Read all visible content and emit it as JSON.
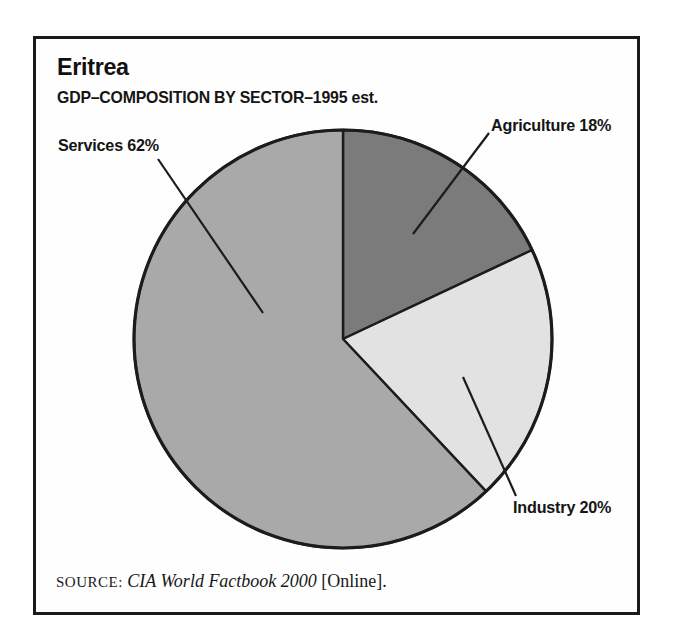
{
  "figure": {
    "country": "Eritrea",
    "subtitle": "GDP–COMPOSITION BY SECTOR–1995 est.",
    "source_prefix": "SOURCE:",
    "source_title": "CIA World Factbook 2000",
    "source_suffix": "[Online]."
  },
  "chart_data": {
    "type": "pie",
    "title": "Eritrea",
    "subtitle": "GDP–COMPOSITION BY SECTOR–1995 est.",
    "start_angle_deg": 0,
    "direction": "clockwise",
    "slices": [
      {
        "name": "Agriculture",
        "value": 18,
        "label": "Agriculture 18%",
        "color": "#7b7b7b"
      },
      {
        "name": "Industry",
        "value": 20,
        "label": "Industry 20%",
        "color": "#e2e2e2"
      },
      {
        "name": "Services",
        "value": 62,
        "label": "Services 62%",
        "color": "#a9a9a9"
      }
    ],
    "source": "SOURCE: CIA World Factbook 2000 [Online]."
  },
  "colors": {
    "outline": "#1c1c1c",
    "frame_border": "#1a1a1a",
    "background": "#ffffff"
  }
}
